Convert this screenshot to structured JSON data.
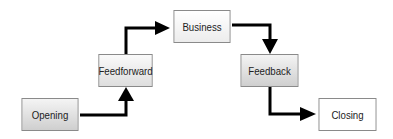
{
  "diagram": {
    "type": "staircase-flow",
    "nodes": [
      {
        "id": "opening",
        "label": "Opening"
      },
      {
        "id": "feedforward",
        "label": "Feedforward"
      },
      {
        "id": "business",
        "label": "Business"
      },
      {
        "id": "feedback",
        "label": "Feedback"
      },
      {
        "id": "closing",
        "label": "Closing"
      }
    ],
    "edges": [
      {
        "from": "opening",
        "to": "feedforward"
      },
      {
        "from": "feedforward",
        "to": "business"
      },
      {
        "from": "business",
        "to": "feedback"
      },
      {
        "from": "feedback",
        "to": "closing"
      }
    ],
    "colors": {
      "arrow": "#000000",
      "border": "#8a8a8a",
      "text": "#222222"
    }
  }
}
